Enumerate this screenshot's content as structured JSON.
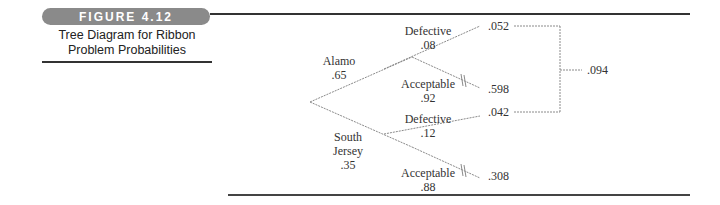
{
  "figure": {
    "badge": "FIGURE 4.12",
    "caption_line1": "Tree Diagram for Ribbon",
    "caption_line2": "Problem Probabilities"
  },
  "tree": {
    "branches": [
      {
        "name": "Alamo",
        "prob": ".65",
        "children": [
          {
            "name": "Defective",
            "prob": ".08",
            "joint": ".052"
          },
          {
            "name": "Acceptable",
            "prob": ".92",
            "joint": ".598"
          }
        ]
      },
      {
        "name_line1": "South",
        "name_line2": "Jersey",
        "prob": ".35",
        "children": [
          {
            "name": "Defective",
            "prob": ".12",
            "joint": ".042"
          },
          {
            "name": "Acceptable",
            "prob": ".88",
            "joint": ".308"
          }
        ]
      }
    ],
    "total_defective": ".094"
  },
  "colors": {
    "line": "#888888",
    "badge_bg": "#8a8a8a",
    "rule": "#333333"
  }
}
